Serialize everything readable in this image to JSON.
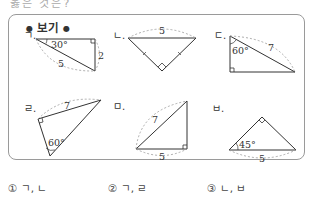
{
  "question_tail": "옳은 것은?",
  "box": {
    "title": "보기"
  },
  "figures": [
    {
      "id": "a",
      "label": "ㄱ.",
      "angle": "30°",
      "side1": "2",
      "hyp": "5"
    },
    {
      "id": "b",
      "label": "ㄴ.",
      "hyp": "5"
    },
    {
      "id": "c",
      "label": "ㄷ.",
      "angle": "60°",
      "hyp": "7"
    },
    {
      "id": "d",
      "label": "ㄹ.",
      "angle": "60°",
      "side": "7"
    },
    {
      "id": "e",
      "label": "ㅁ.",
      "hyp": "7",
      "base": "5"
    },
    {
      "id": "f",
      "label": "ㅂ.",
      "angle": "45°",
      "base": "5"
    }
  ],
  "options": [
    {
      "num": "①",
      "text": "ㄱ, ㄴ"
    },
    {
      "num": "②",
      "text": "ㄱ, ㄹ"
    },
    {
      "num": "③",
      "text": "ㄴ, ㅂ"
    }
  ],
  "colors": {
    "border": "#9a9a9a",
    "line": "#333333",
    "dashed": "#999999"
  }
}
